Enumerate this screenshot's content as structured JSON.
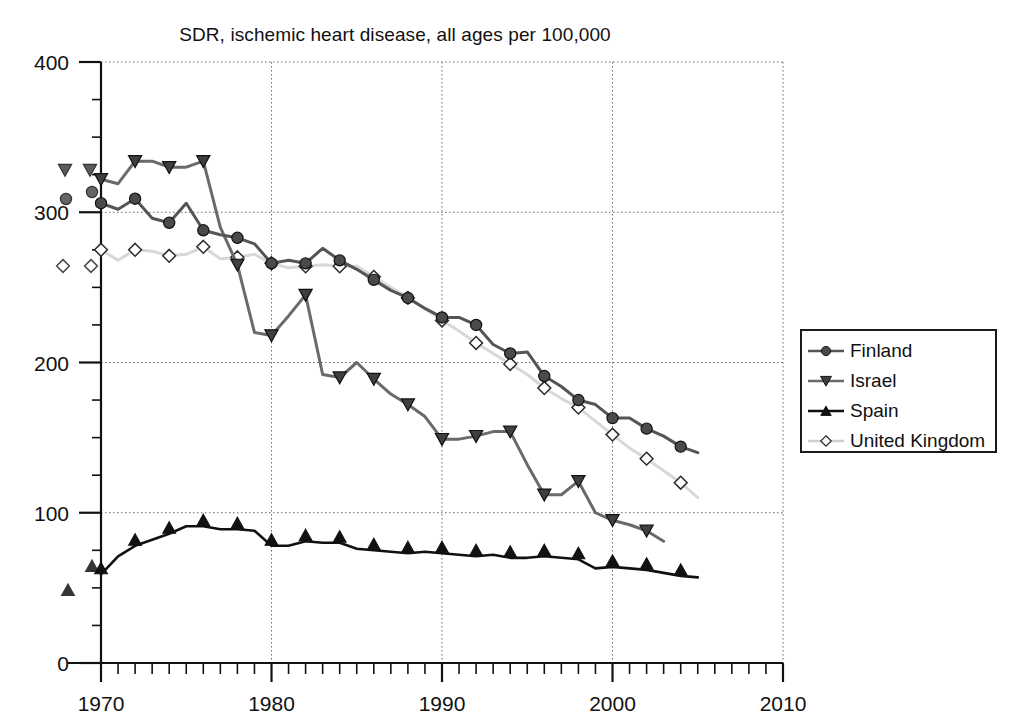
{
  "chart_data": {
    "type": "line",
    "title": "SDR, ischemic heart disease, all ages per 100,000",
    "xlabel": "",
    "ylabel": "",
    "xlim": [
      1969,
      2010
    ],
    "ylim": [
      0,
      400
    ],
    "xticks": [
      1970,
      1980,
      1990,
      2000,
      2010
    ],
    "yticks": [
      0,
      100,
      200,
      300,
      400
    ],
    "grid": true,
    "legend_position": "right",
    "series": [
      {
        "name": "Finland",
        "marker": "circle-filled",
        "color": "#555555",
        "x": [
          1970,
          1971,
          1972,
          1973,
          1974,
          1975,
          1976,
          1977,
          1978,
          1979,
          1980,
          1981,
          1982,
          1983,
          1984,
          1985,
          1986,
          1987,
          1988,
          1989,
          1990,
          1991,
          1992,
          1993,
          1994,
          1995,
          1996,
          1997,
          1998,
          1999,
          2000,
          2001,
          2002,
          2003,
          2004,
          2005
        ],
        "y": [
          306,
          302,
          309,
          296,
          293,
          306,
          288,
          285,
          283,
          279,
          266,
          268,
          266,
          276,
          268,
          262,
          255,
          248,
          243,
          236,
          230,
          230,
          225,
          212,
          206,
          207,
          191,
          184,
          175,
          172,
          163,
          163,
          156,
          151,
          144,
          140
        ]
      },
      {
        "name": "Israel",
        "marker": "triangle-down-filled",
        "color": "#6a6a6a",
        "x": [
          1970,
          1971,
          1972,
          1973,
          1974,
          1975,
          1976,
          1977,
          1978,
          1979,
          1980,
          1981,
          1982,
          1983,
          1984,
          1985,
          1986,
          1987,
          1988,
          1989,
          1990,
          1991,
          1992,
          1993,
          1994,
          1995,
          1996,
          1997,
          1998,
          1999,
          2000,
          2001,
          2002,
          2003
        ],
        "y": [
          322,
          319,
          334,
          334,
          330,
          330,
          334,
          290,
          265,
          220,
          218,
          231,
          245,
          192,
          190,
          200,
          189,
          179,
          172,
          164,
          149,
          149,
          151,
          154,
          154,
          132,
          112,
          112,
          121,
          100,
          95,
          92,
          88,
          81
        ]
      },
      {
        "name": "Spain",
        "marker": "triangle-up-filled",
        "color": "#111111",
        "x": [
          1970,
          1971,
          1972,
          1973,
          1974,
          1975,
          1976,
          1977,
          1978,
          1979,
          1980,
          1981,
          1982,
          1983,
          1984,
          1985,
          1986,
          1987,
          1988,
          1989,
          1990,
          1991,
          1992,
          1993,
          1994,
          1995,
          1996,
          1997,
          1998,
          1999,
          2000,
          2001,
          2002,
          2003,
          2004,
          2005
        ],
        "y": [
          59,
          71,
          78,
          82,
          86,
          91,
          91,
          89,
          89,
          88,
          78,
          78,
          81,
          80,
          80,
          76,
          75,
          74,
          73,
          74,
          73,
          72,
          71,
          72,
          70,
          70,
          71,
          70,
          69,
          63,
          64,
          63,
          62,
          60,
          58,
          57
        ]
      },
      {
        "name": "United Kingdom",
        "marker": "diamond-open",
        "color": "#d8d8d8",
        "x": [
          1970,
          1971,
          1972,
          1973,
          1974,
          1975,
          1976,
          1977,
          1978,
          1979,
          1980,
          1981,
          1982,
          1983,
          1984,
          1985,
          1986,
          1987,
          1988,
          1989,
          1990,
          1991,
          1992,
          1993,
          1994,
          1995,
          1996,
          1997,
          1998,
          1999,
          2000,
          2001,
          2002,
          2003,
          2004,
          2005
        ],
        "y": [
          275,
          268,
          275,
          274,
          271,
          272,
          277,
          269,
          270,
          272,
          266,
          263,
          264,
          265,
          264,
          264,
          257,
          250,
          243,
          236,
          228,
          221,
          213,
          206,
          199,
          192,
          183,
          176,
          170,
          161,
          152,
          143,
          136,
          128,
          120,
          110
        ]
      }
    ]
  },
  "legend": {
    "items": [
      {
        "label": "Finland",
        "marker": "circle-filled",
        "color": "#555555"
      },
      {
        "label": "Israel",
        "marker": "triangle-down-filled",
        "color": "#6a6a6a"
      },
      {
        "label": "Spain",
        "marker": "triangle-up-filled",
        "color": "#111111"
      },
      {
        "label": "United Kingdom",
        "marker": "diamond-open",
        "color": "#cfcfcf"
      }
    ]
  },
  "axes": {
    "x_tick_labels": [
      "1970",
      "1980",
      "1990",
      "2000",
      "2010"
    ],
    "y_tick_labels": [
      "0",
      "100",
      "200",
      "300",
      "400"
    ]
  }
}
